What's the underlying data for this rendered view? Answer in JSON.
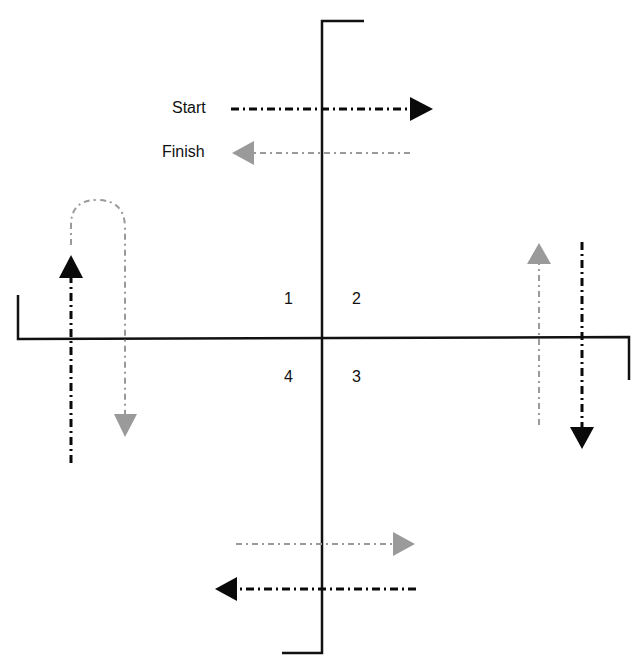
{
  "labels": {
    "start": "Start",
    "finish": "Finish"
  },
  "quadrants": {
    "q1": "1",
    "q2": "2",
    "q3": "3",
    "q4": "4"
  },
  "colors": {
    "axis": "#111111",
    "dark_arrow": "#0a0a0a",
    "grey_arrow": "#9a9a9a"
  },
  "legend": [
    {
      "label": "Start",
      "style": "black dash-dot arrow pointing right"
    },
    {
      "label": "Finish",
      "style": "grey dash-dot arrow pointing left"
    }
  ]
}
